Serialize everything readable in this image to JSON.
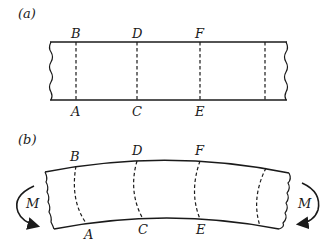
{
  "figure": {
    "panel_a": {
      "label": "(a)",
      "top_points": [
        "B",
        "D",
        "F"
      ],
      "bottom_points": [
        "A",
        "C",
        "E"
      ]
    },
    "panel_b": {
      "label": "(b)",
      "top_points": [
        "B",
        "D",
        "F"
      ],
      "bottom_points": [
        "A",
        "C",
        "E"
      ],
      "moment_left": "M",
      "moment_right": "M"
    }
  }
}
